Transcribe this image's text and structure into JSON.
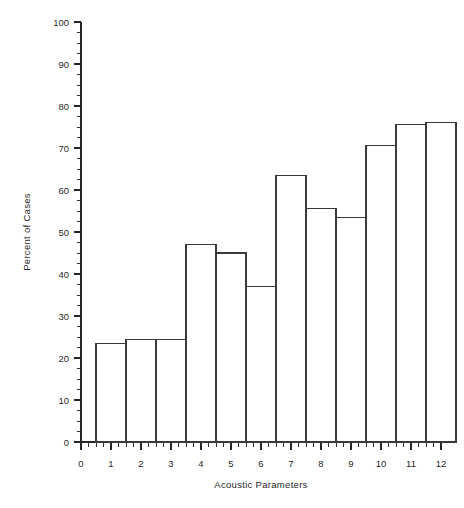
{
  "chart_data": {
    "type": "bar",
    "title": "",
    "xlabel": "Acoustic Parameters",
    "ylabel": "Percent of Cases",
    "categories": [
      "1",
      "2",
      "3",
      "4",
      "5",
      "6",
      "7",
      "8",
      "9",
      "10",
      "11",
      "12"
    ],
    "values": [
      23.5,
      24.5,
      24.5,
      47.0,
      45.0,
      37.0,
      63.5,
      55.5,
      53.5,
      70.5,
      75.5,
      76.0
    ],
    "xlim": [
      0,
      12
    ],
    "ylim": [
      0,
      100
    ],
    "x_ticks": [
      "0",
      "1",
      "2",
      "3",
      "4",
      "5",
      "6",
      "7",
      "8",
      "9",
      "10",
      "11",
      "12"
    ],
    "y_ticks": [
      "0",
      "10",
      "20",
      "30",
      "40",
      "50",
      "60",
      "70",
      "80",
      "90",
      "100"
    ],
    "x_minor_per_major": 4,
    "y_minor_per_major": 4,
    "bar_start_offset": 0.5,
    "bar_width": 1.0,
    "grid": false,
    "legend": null,
    "bar_fill": "#ffffff",
    "bar_stroke": "#3a3a3a",
    "axis_color": "#262626",
    "background": "#ffffff"
  }
}
